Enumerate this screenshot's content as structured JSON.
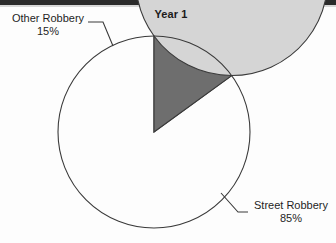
{
  "page": {
    "background_color": "#fdfdfd",
    "scan_band_color": "#2b2b2b"
  },
  "chart_data": {
    "type": "pie",
    "title": "Year 1",
    "xlabel": "",
    "ylabel": "",
    "legend_position": "none",
    "grid": false,
    "labels_outside": true,
    "start_angle_deg": 90,
    "direction": "counterclockwise",
    "categories": [
      "Other Robbery",
      "Street Robbery"
    ],
    "values": [
      15,
      85
    ],
    "value_suffix": "%",
    "slices": [
      {
        "name": "Other Robbery",
        "value": 15,
        "value_label": "15%",
        "color": "#6e6e6e",
        "stroke": "#3a3a3a"
      },
      {
        "name": "Street Robbery",
        "value": 85,
        "value_label": "85%",
        "color": "#d5d5d5",
        "stroke": "#3a3a3a"
      }
    ]
  },
  "labels": {
    "other": {
      "name": "Other Robbery",
      "percent": "15%"
    },
    "street": {
      "name": "Street Robbery",
      "percent": "85%"
    }
  },
  "geometry": {
    "center_x": 154,
    "center_y": 132,
    "radius": 96
  }
}
